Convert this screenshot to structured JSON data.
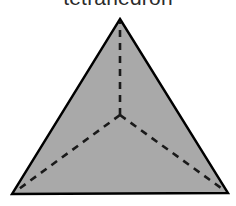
{
  "figure": {
    "title": "tetrahedron",
    "caption_clipped": true,
    "background_color": "#ffffff"
  },
  "diagram": {
    "name": "tetrahedron",
    "type": "polyhedron-net-projection",
    "fill_color": "#a9a9a9",
    "outline_color": "#000000",
    "hidden_edge_color": "#1a1a1a",
    "outline_width": 2,
    "hidden_edge_width": 2.6,
    "hidden_edge_dash": "7 6",
    "vertices": {
      "apex": {
        "label": "apex",
        "x": 120,
        "y": 19
      },
      "bottom_left": {
        "label": "bottom-left",
        "x": 12,
        "y": 194
      },
      "bottom_right": {
        "label": "bottom-right",
        "x": 228,
        "y": 193
      },
      "center": {
        "label": "center",
        "x": 120,
        "y": 115
      }
    },
    "solid_edges": [
      {
        "name": "edge-apex-to-bottom-left",
        "from": "apex",
        "to": "bottom_left"
      },
      {
        "name": "edge-apex-to-bottom-right",
        "from": "apex",
        "to": "bottom_right"
      },
      {
        "name": "edge-bottom",
        "from": "bottom_left",
        "to": "bottom_right"
      }
    ],
    "hidden_edges": [
      {
        "name": "hidden-edge-center-to-apex",
        "from": "center",
        "to": "apex"
      },
      {
        "name": "hidden-edge-center-to-bottom-left",
        "from": "center",
        "to": "bottom_left"
      },
      {
        "name": "hidden-edge-center-to-bottom-right",
        "from": "center",
        "to": "bottom_right"
      }
    ]
  }
}
